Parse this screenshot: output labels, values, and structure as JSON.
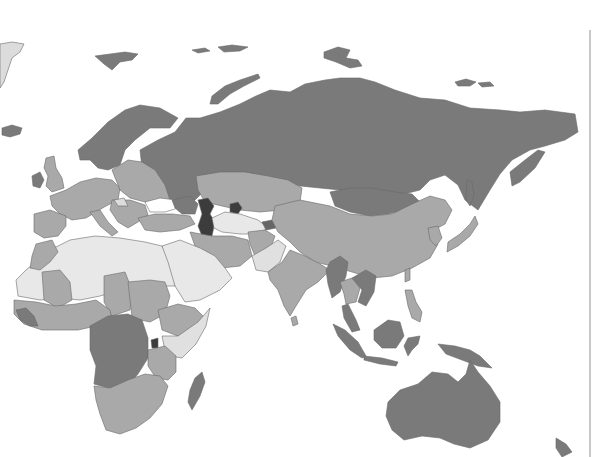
{
  "map": {
    "title": "",
    "type": "choropleth",
    "projection": "Eurasia-Africa-Oceania",
    "palette": {
      "white": "#f0f0f0",
      "light": "#cfcfcf",
      "mid": "#a9a9a9",
      "dark": "#7a7a7a",
      "darkest": "#3c3c3c",
      "border": "#6a6a6a",
      "water": "#ffffff"
    },
    "legend": null,
    "regions": [
      {
        "name": "greenland-tip",
        "shade": "light"
      },
      {
        "name": "iceland",
        "shade": "dark"
      },
      {
        "name": "svalbard",
        "shade": "dark"
      },
      {
        "name": "franz-josef-land",
        "shade": "dark"
      },
      {
        "name": "novaya-zemlya",
        "shade": "dark"
      },
      {
        "name": "scandinavia",
        "shade": "dark"
      },
      {
        "name": "russia",
        "shade": "dark"
      },
      {
        "name": "severnaya-zemlya",
        "shade": "dark"
      },
      {
        "name": "new-siberian-islands",
        "shade": "dark"
      },
      {
        "name": "kamchatka",
        "shade": "dark"
      },
      {
        "name": "sakhalin",
        "shade": "dark"
      },
      {
        "name": "mongolia",
        "shade": "dark"
      },
      {
        "name": "ireland",
        "shade": "dark"
      },
      {
        "name": "great-britain",
        "shade": "mid"
      },
      {
        "name": "western-europe",
        "shade": "mid"
      },
      {
        "name": "iberia",
        "shade": "mid"
      },
      {
        "name": "italy",
        "shade": "mid"
      },
      {
        "name": "eastern-europe",
        "shade": "mid"
      },
      {
        "name": "balkans",
        "shade": "mid"
      },
      {
        "name": "turkey",
        "shade": "mid"
      },
      {
        "name": "kazakhstan",
        "shade": "mid"
      },
      {
        "name": "uzbekistan-turkmenistan",
        "shade": "white"
      },
      {
        "name": "caspian-sea",
        "shade": "darkest"
      },
      {
        "name": "aral-sea",
        "shade": "darkest"
      },
      {
        "name": "china",
        "shade": "mid"
      },
      {
        "name": "korea",
        "shade": "mid"
      },
      {
        "name": "japan",
        "shade": "mid"
      },
      {
        "name": "iran",
        "shade": "mid"
      },
      {
        "name": "afghanistan",
        "shade": "mid"
      },
      {
        "name": "pakistan",
        "shade": "white"
      },
      {
        "name": "india",
        "shade": "mid"
      },
      {
        "name": "sri-lanka",
        "shade": "mid"
      },
      {
        "name": "myanmar",
        "shade": "dark"
      },
      {
        "name": "thailand",
        "shade": "mid"
      },
      {
        "name": "indochina-east",
        "shade": "dark"
      },
      {
        "name": "malay-peninsula",
        "shade": "dark"
      },
      {
        "name": "sumatra",
        "shade": "dark"
      },
      {
        "name": "java",
        "shade": "dark"
      },
      {
        "name": "borneo",
        "shade": "dark"
      },
      {
        "name": "sulawesi",
        "shade": "dark"
      },
      {
        "name": "philippines",
        "shade": "mid"
      },
      {
        "name": "taiwan",
        "shade": "mid"
      },
      {
        "name": "new-guinea",
        "shade": "dark"
      },
      {
        "name": "australia",
        "shade": "dark"
      },
      {
        "name": "new-zealand",
        "shade": "dark"
      },
      {
        "name": "arabia",
        "shade": "white"
      },
      {
        "name": "north-africa",
        "shade": "white"
      },
      {
        "name": "morocco",
        "shade": "mid"
      },
      {
        "name": "sahel",
        "shade": "mid"
      },
      {
        "name": "sudan-region",
        "shade": "mid"
      },
      {
        "name": "ethiopia",
        "shade": "mid"
      },
      {
        "name": "somalia-kenya",
        "shade": "white"
      },
      {
        "name": "west-africa",
        "shade": "mid"
      },
      {
        "name": "liberia-guinea",
        "shade": "dark"
      },
      {
        "name": "central-africa",
        "shade": "dark"
      },
      {
        "name": "east-africa",
        "shade": "mid"
      },
      {
        "name": "southern-africa",
        "shade": "mid"
      },
      {
        "name": "madagascar",
        "shade": "dark"
      }
    ]
  }
}
